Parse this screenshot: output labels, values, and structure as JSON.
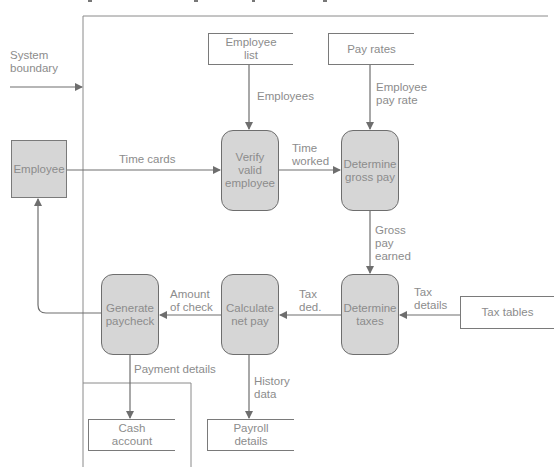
{
  "diagram": {
    "type": "data-flow-diagram",
    "boundary_label": "System\nboundary",
    "external_entities": [
      {
        "id": "employee",
        "label": "Employee"
      },
      {
        "id": "tax_tables",
        "label": "Tax tables"
      }
    ],
    "processes": [
      {
        "id": "verify",
        "label": "Verify\nvalid\nemployee"
      },
      {
        "id": "gross",
        "label": "Determine\ngross pay"
      },
      {
        "id": "taxes",
        "label": "Determine\ntaxes"
      },
      {
        "id": "netpay",
        "label": "Calculate\nnet pay"
      },
      {
        "id": "paycheck",
        "label": "Generate\npaycheck"
      }
    ],
    "data_stores": [
      {
        "id": "employee_list",
        "label": "Employee\nlist"
      },
      {
        "id": "pay_rates",
        "label": "Pay rates"
      },
      {
        "id": "cash_account",
        "label": "Cash\naccount"
      },
      {
        "id": "payroll_details",
        "label": "Payroll\ndetails"
      }
    ],
    "flows": [
      {
        "from": "employee",
        "to": "verify",
        "label": "Time cards"
      },
      {
        "from": "employee_list",
        "to": "verify",
        "label": "Employees"
      },
      {
        "from": "verify",
        "to": "gross",
        "label": "Time\nworked"
      },
      {
        "from": "pay_rates",
        "to": "gross",
        "label": "Employee\npay rate"
      },
      {
        "from": "gross",
        "to": "taxes",
        "label": "Gross\npay\nearned"
      },
      {
        "from": "tax_tables",
        "to": "taxes",
        "label": "Tax\ndetails"
      },
      {
        "from": "taxes",
        "to": "netpay",
        "label": "Tax\nded."
      },
      {
        "from": "netpay",
        "to": "paycheck",
        "label": "Amount\nof check"
      },
      {
        "from": "netpay",
        "to": "payroll_details",
        "label": "History\ndata"
      },
      {
        "from": "paycheck",
        "to": "cash_account",
        "label": "Payment details"
      },
      {
        "from": "paycheck",
        "to": "employee",
        "label": ""
      }
    ]
  },
  "colors": {
    "process_fill": "#d6d6d6",
    "line": "#707070",
    "text": "#8c8c8c"
  }
}
